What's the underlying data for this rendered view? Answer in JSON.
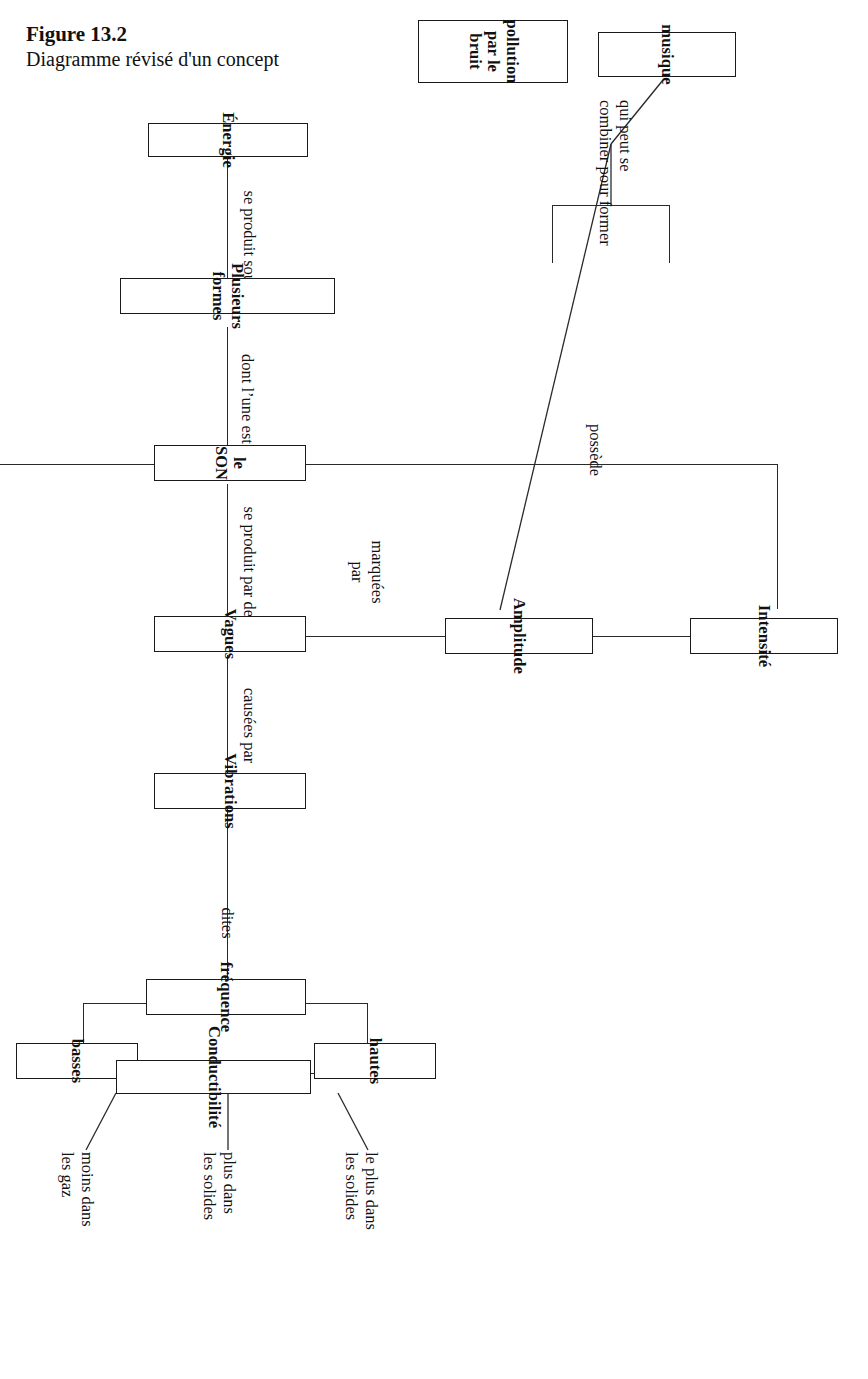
{
  "figure": {
    "number": "Figure 13.2",
    "caption": "Diagramme révisé d'un concept"
  },
  "diagram": {
    "type": "concept-map",
    "language": "fr",
    "orientation": "rotated-90-clockwise",
    "root": "le SON",
    "nodes": [
      {
        "id": "energie",
        "label": "Énergie"
      },
      {
        "id": "plusieurs",
        "label": "Plusieurs  formes"
      },
      {
        "id": "son",
        "label": "le SON"
      },
      {
        "id": "vagues",
        "label": "Vagues"
      },
      {
        "id": "vibrations",
        "label": "Vibrations"
      },
      {
        "id": "amplitude",
        "label": "Amplitude"
      },
      {
        "id": "intensite",
        "label": "Intensité"
      },
      {
        "id": "frequence",
        "label": "fréquence"
      },
      {
        "id": "hautes",
        "label": "hautes"
      },
      {
        "id": "basses",
        "label": "basses"
      },
      {
        "id": "musique",
        "label": "musique"
      },
      {
        "id": "pollution",
        "label": "pollution\npar le bruit"
      },
      {
        "id": "conductibilite",
        "label": "Conductibilité"
      }
    ],
    "links": [
      {
        "from": "energie",
        "to": "plusieurs",
        "label": "se produit sous"
      },
      {
        "from": "plusieurs",
        "to": "son",
        "label": "dont l’une est"
      },
      {
        "from": "son",
        "to": "vagues",
        "label": "se produit par des"
      },
      {
        "from": "vagues",
        "to": "vibrations",
        "label": "causées par"
      },
      {
        "from": "vagues",
        "to": "amplitude",
        "label": "marquées\npar"
      },
      {
        "from": "amplitude",
        "to": "intensite",
        "label": ""
      },
      {
        "from": "vibrations",
        "to": "frequence",
        "label": "dites"
      },
      {
        "from": "frequence",
        "to": "hautes",
        "label": ""
      },
      {
        "from": "frequence",
        "to": "basses",
        "label": ""
      },
      {
        "from": "intensite",
        "to": "musique",
        "label": "qui peut se\ncombiner pour former"
      },
      {
        "from": "intensite",
        "to": "pollution",
        "label": "qui peut se\ncombiner pour former"
      },
      {
        "from": "son",
        "to": "intensite",
        "label": "possède"
      },
      {
        "from": "son",
        "to": "conductibilite",
        "label": "possède"
      }
    ],
    "annotations": [
      {
        "node": "conductibilite",
        "label": "le plus dans\nles solides"
      },
      {
        "node": "conductibilite",
        "label": "plus dans\nles solides"
      },
      {
        "node": "conductibilite",
        "label": "moins dans\nles gaz"
      }
    ],
    "edge_labels": {
      "se_produit_sous": "se produit sous",
      "dont_lune_est": "dont l’une est",
      "se_produit_par_des": "se produit par des",
      "causees_par": "causées par",
      "marquees_par": "marquées\npar",
      "dites": "dites",
      "qui_peut_se_combiner": "qui peut se\ncombiner pour former",
      "possede_top": "possède",
      "possede_bottom": "possède"
    },
    "colors": {
      "stroke": "#1a1a1a",
      "background": "#ffffff",
      "text": "#111111"
    }
  }
}
